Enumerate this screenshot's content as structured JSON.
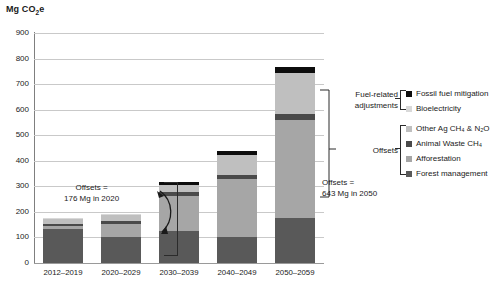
{
  "chart_data": {
    "type": "bar",
    "stacked": true,
    "title": "",
    "ylabel": "Mg CO2e",
    "ylabel_rich": "Mg CO₂e",
    "xlabel": "",
    "ylim": [
      0,
      900
    ],
    "ytick_step": 100,
    "yticks": [
      0,
      100,
      200,
      300,
      400,
      500,
      600,
      700,
      800,
      900
    ],
    "grid": true,
    "grid_axis": "y",
    "legend_position": "right",
    "categories": [
      "2012–2019",
      "2020–2029",
      "2030–2039",
      "2040–2049",
      "2050–2059"
    ],
    "series": [
      {
        "name": "Forest management",
        "key": "forest-management",
        "color": "#595959",
        "values": [
          132,
          103,
          126,
          100,
          175
        ]
      },
      {
        "name": "Afforestation",
        "key": "afforestation",
        "color": "#a6a6a6",
        "values": [
          12,
          48,
          135,
          228,
          385
        ]
      },
      {
        "name": "Animal Waste CH4",
        "key": "animal-waste-ch4",
        "color": "#4a4a4a",
        "values": [
          10,
          12,
          15,
          18,
          25
        ]
      },
      {
        "name": "Other Ag CH4 & N2O",
        "key": "other-ag-ch4-n2o",
        "color": "#bfbfbf",
        "values": [
          20,
          24,
          30,
          75,
          160
        ]
      },
      {
        "name": "Bioelectricity",
        "key": "bioelectricity",
        "color": "#d9d9d9",
        "values": [
          3,
          5,
          0,
          0,
          0
        ]
      },
      {
        "name": "Fossil fuel mitigation",
        "key": "fossil-fuel-mitigation",
        "color": "#0d0d0d",
        "values": [
          0,
          0,
          12,
          16,
          23
        ]
      }
    ],
    "totals": [
      177,
      192,
      318,
      437,
      768
    ],
    "annotations": [
      {
        "id": "offsets-2020",
        "line1": "Offsets =",
        "line2": "176 Mg in 2020",
        "value": 176,
        "year": 2020
      },
      {
        "id": "offsets-2050",
        "line1": "Offsets =",
        "line2": "643 Mg in 2050",
        "value": 643,
        "year": 2050
      }
    ]
  },
  "legend": {
    "groups": [
      {
        "title_line1": "Fuel-related",
        "title_line2": "adjustments",
        "title": "Fuel-related adjustments",
        "items": [
          {
            "label": "Fossil fuel mitigation",
            "color": "#0d0d0d"
          },
          {
            "label": "Bioelectricity",
            "color": "#d9d9d9"
          }
        ]
      },
      {
        "title_line1": "Offsets",
        "title_line2": "",
        "title": "Offsets",
        "items": [
          {
            "label": "Other Ag CH₄ & N₂O",
            "color": "#bfbfbf"
          },
          {
            "label": "Animal Waste CH₄",
            "color": "#4a4a4a"
          },
          {
            "label": "Afforestation",
            "color": "#a6a6a6"
          },
          {
            "label": "Forest management",
            "color": "#595959"
          }
        ]
      }
    ]
  }
}
